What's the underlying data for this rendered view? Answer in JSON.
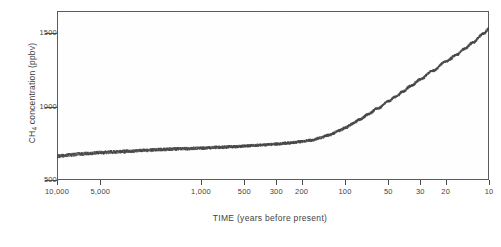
{
  "chart_data": {
    "type": "line",
    "title": "",
    "xlabel": "TIME  (years before present)",
    "ylabel": "CH4 concentration  (ppbv)",
    "ylabel_parts": {
      "prefix": "CH",
      "subscript": "4",
      "suffix": " concentration  (ppbv)"
    },
    "xscale": "log-reversed",
    "xlim": [
      10000,
      10
    ],
    "ylim": [
      500,
      1650
    ],
    "grid": false,
    "legend": null,
    "style": "stippled-dotted-band",
    "xticks": [
      {
        "value": 10000,
        "label": "10,000"
      },
      {
        "value": 5000,
        "label": "5,000"
      },
      {
        "value": 1000,
        "label": "1,000"
      },
      {
        "value": 500,
        "label": "500"
      },
      {
        "value": 300,
        "label": "300"
      },
      {
        "value": 200,
        "label": "200"
      },
      {
        "value": 100,
        "label": "100"
      },
      {
        "value": 50,
        "label": "50"
      },
      {
        "value": 30,
        "label": "30"
      },
      {
        "value": 20,
        "label": "20"
      },
      {
        "value": 10,
        "label": "10"
      }
    ],
    "yticks": [
      {
        "value": 500,
        "label": "500"
      },
      {
        "value": 1000,
        "label": "1000"
      },
      {
        "value": 1500,
        "label": "1500"
      }
    ],
    "series": [
      {
        "name": "CH4 concentration",
        "x": [
          10000,
          9000,
          8000,
          7000,
          6000,
          5000,
          4000,
          3000,
          2500,
          2000,
          1500,
          1000,
          800,
          600,
          500,
          400,
          300,
          250,
          200,
          170,
          150,
          130,
          110,
          100,
          90,
          80,
          70,
          60,
          50,
          45,
          40,
          35,
          30,
          25,
          20,
          17,
          15,
          13,
          11,
          10
        ],
        "y": [
          665,
          670,
          675,
          680,
          685,
          690,
          695,
          700,
          705,
          710,
          715,
          720,
          725,
          730,
          735,
          740,
          748,
          755,
          765,
          775,
          790,
          810,
          840,
          860,
          885,
          915,
          950,
          990,
          1040,
          1070,
          1105,
          1145,
          1190,
          1245,
          1310,
          1355,
          1395,
          1440,
          1500,
          1540
        ]
      }
    ]
  }
}
